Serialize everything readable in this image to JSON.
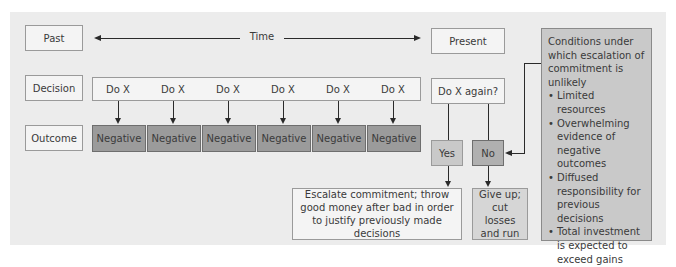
{
  "row_labels": {
    "past": "Past",
    "decision": "Decision",
    "outcome": "Outcome"
  },
  "timeline": {
    "label": "Time",
    "present": "Present"
  },
  "decisions": [
    "Do X",
    "Do X",
    "Do X",
    "Do X",
    "Do X",
    "Do X"
  ],
  "outcomes": [
    "Negative",
    "Negative",
    "Negative",
    "Negative",
    "Negative",
    "Negative"
  ],
  "choice": {
    "question": "Do X again?",
    "yes": "Yes",
    "no": "No"
  },
  "results": {
    "yes_result": "Escalate commitment; throw good money after bad in order to justify previously made decisions",
    "no_result": "Give up; cut losses and run"
  },
  "conditions": {
    "heading": "Conditions under which escalation of commitment is unlikely",
    "items": [
      "Limited resources",
      "Overwhelming evidence of negative outcomes",
      "Diffused responsibility for previous decisions",
      "Total investment is expected to exceed gains"
    ]
  },
  "colors": {
    "background": "#ececec",
    "light_box": "#f4f4f4",
    "mid_box": "#c9c9c9",
    "dark_box": "#9b9b9b"
  }
}
